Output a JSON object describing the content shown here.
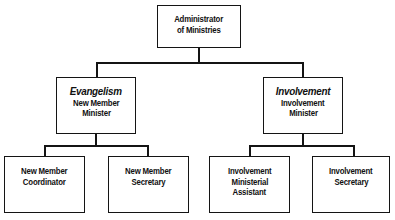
{
  "chart_data": {
    "type": "diagram",
    "diagram_kind": "organizational-chart",
    "orientation": "top-down",
    "levels": 3,
    "border_color": "#141414",
    "box_fill_color": "#ffffff",
    "text_color": "#111111",
    "nodes": [
      {
        "id": "root",
        "level": 1,
        "lines": [
          "Administrator",
          "of Ministries"
        ],
        "parent": null
      },
      {
        "id": "evangelism",
        "level": 2,
        "heading": "Evangelism",
        "heading_style": "italic",
        "lines": [
          "New Member",
          "Minister"
        ],
        "parent": "root"
      },
      {
        "id": "involvement",
        "level": 2,
        "heading": "Involvement",
        "heading_style": "italic",
        "lines": [
          "Involvement",
          "Minister"
        ],
        "parent": "root"
      },
      {
        "id": "new_member_coordinator",
        "level": 3,
        "lines": [
          "New Member",
          "Coordinator"
        ],
        "parent": "evangelism"
      },
      {
        "id": "new_member_secretary",
        "level": 3,
        "lines": [
          "New Member",
          "Secretary"
        ],
        "parent": "evangelism"
      },
      {
        "id": "involvement_ministerial_assistant",
        "level": 3,
        "lines": [
          "Involvement",
          "Ministerial",
          "Assistant"
        ],
        "parent": "involvement"
      },
      {
        "id": "involvement_secretary",
        "level": 3,
        "lines": [
          "Involvement",
          "Secretary"
        ],
        "parent": "involvement"
      }
    ]
  },
  "nodes": {
    "root": {
      "line1": "Administrator",
      "line2": "of Ministries"
    },
    "evangelism": {
      "heading": "Evangelism",
      "line1": "New Member",
      "line2": "Minister"
    },
    "involvement": {
      "heading": "Involvement",
      "line1": "Involvement",
      "line2": "Minister"
    },
    "new_member_coordinator": {
      "line1": "New Member",
      "line2": "Coordinator"
    },
    "new_member_secretary": {
      "line1": "New Member",
      "line2": "Secretary"
    },
    "involvement_ministerial_assistant": {
      "line1": "Involvement",
      "line2": "Ministerial",
      "line3": "Assistant"
    },
    "involvement_secretary": {
      "line1": "Involvement",
      "line2": "Secretary"
    }
  }
}
